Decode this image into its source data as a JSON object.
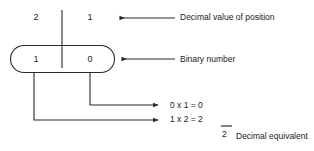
{
  "diagram": {
    "colors": {
      "line": "#2b2b2b",
      "text": "#1a1a1a",
      "background": "#ffffff"
    },
    "position_weights": {
      "row_label": "Decimal value of position",
      "values": [
        "2",
        "1"
      ]
    },
    "binary_number": {
      "row_label": "Binary number",
      "bits": [
        "1",
        "0"
      ]
    },
    "calculations": [
      {
        "bit": "0",
        "weight": "1",
        "operator": "x",
        "equals": "=",
        "product": "0",
        "text": "0 x 1 = 0"
      },
      {
        "bit": "1",
        "weight": "2",
        "operator": "x",
        "equals": "=",
        "product": "2",
        "text": "1 x 2 = 2"
      }
    ],
    "sum": {
      "total": "2",
      "label": "Decimal equivalent"
    },
    "arrows": {
      "top_direction": "left",
      "middle_direction": "left",
      "calc_direction": "right"
    },
    "icons": {
      "arrow_left": "arrow-left-icon",
      "arrow_right": "arrow-right-icon"
    }
  }
}
